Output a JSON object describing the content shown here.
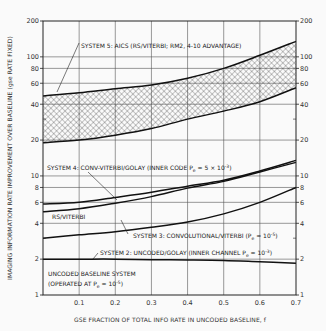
{
  "chart_data": {
    "type": "line",
    "title": "",
    "xlabel": "GSE FRACTION OF TOTAL INFO RATE IN UNCODED BASELINE, f",
    "ylabel": "IMAGING INFORMATION RATE IMPROVEMENT OVER BASELINE (gse RATE FIXED)",
    "xlim": [
      0,
      0.7
    ],
    "ylim": [
      1,
      200
    ],
    "yscale": "log",
    "grid": true,
    "x_ticks": [
      "0.1",
      "0.2",
      "0.3",
      "0.4",
      "0.5",
      "0.6",
      "0.7"
    ],
    "x_tick_values": [
      0.1,
      0.2,
      0.3,
      0.4,
      0.5,
      0.6,
      0.7
    ],
    "y_ticks_left": [
      "1",
      "2",
      "4",
      "6",
      "8",
      "10",
      "20",
      "40",
      "60",
      "80",
      "100",
      "200"
    ],
    "y_ticks_right": [
      "1",
      "2",
      "4",
      "6",
      "8",
      "10",
      "20",
      "40",
      "60",
      "80",
      "100",
      "200"
    ],
    "y_tick_values": [
      1,
      2,
      4,
      6,
      8,
      10,
      20,
      40,
      60,
      80,
      100,
      200
    ],
    "x": [
      0,
      0.1,
      0.2,
      0.3,
      0.4,
      0.5,
      0.6,
      0.7
    ],
    "series": [
      {
        "name": "System 5 upper bound",
        "values": [
          47,
          50,
          54,
          58,
          66,
          80,
          103,
          135
        ]
      },
      {
        "name": "System 5 lower bound",
        "values": [
          19,
          20,
          22,
          25,
          30,
          35,
          42,
          55
        ]
      },
      {
        "name": "System 4: Conv-Viterbi/Golay",
        "values": [
          5.8,
          6.0,
          6.6,
          7.3,
          8.2,
          9.2,
          11,
          13.5
        ]
      },
      {
        "name": "RS/Viterbi",
        "values": [
          5.0,
          5.3,
          5.9,
          6.7,
          7.9,
          9.0,
          10.8,
          13
        ]
      },
      {
        "name": "System 3: Convolutional/Viterbi",
        "values": [
          3.0,
          3.2,
          3.4,
          3.7,
          4.1,
          4.8,
          6.0,
          8.0
        ]
      },
      {
        "name": "System 2: Uncoded/Golay",
        "values": [
          2.0,
          2.0,
          2.0,
          1.98,
          1.97,
          1.95,
          1.9,
          1.85
        ]
      },
      {
        "name": "Uncoded baseline system",
        "values": [
          1,
          1,
          1,
          1,
          1,
          1,
          1,
          1
        ]
      }
    ],
    "shaded_region": {
      "name": "System 5: AICS",
      "between": [
        "System 5 upper bound",
        "System 5 lower bound"
      ],
      "pattern": "crosshatch"
    },
    "annotations": [
      {
        "id": "sys5",
        "text": "SYSTEM 5:  AICS (RS/VITERBI; RM2, 4-10 ADVANTAGE)"
      },
      {
        "id": "sys4_a",
        "text": "SYSTEM 4:  CONV-VITERBI/GOLAY (INNER CODE P",
        "sub": "e",
        "tail": " = 5 × 10",
        "sup": "-3",
        "end": ")"
      },
      {
        "id": "rsv",
        "text": "RS/VITERBI"
      },
      {
        "id": "sys3",
        "text": "SYSTEM 3:  CONVOLUTIONAL/VITERBI (P",
        "sub": "e",
        "tail": " = 10",
        "sup": "-5",
        "end": ")"
      },
      {
        "id": "sys2",
        "text": "SYSTEM 2:  UNCODED/GOLAY (INNER CHANNEL P",
        "sub": "e",
        "tail": " = 10",
        "sup": "-3",
        "end": ")"
      },
      {
        "id": "base1",
        "text": "UNCODED BASELINE SYSTEM"
      },
      {
        "id": "base2",
        "text": "(OPERATED AT P",
        "sub": "e",
        "tail": " = 10",
        "sup": "-5",
        "end": ")"
      }
    ]
  },
  "labels": {
    "xlabel": "GSE FRACTION OF TOTAL INFO RATE IN UNCODED BASELINE, f",
    "ylabel": "IMAGING INFORMATION RATE IMPROVEMENT OVER BASELINE (gse RATE FIXED)"
  },
  "colors": {
    "line": "#111111",
    "grid": "#555555",
    "text": "#333333",
    "background": "#fafafa"
  }
}
